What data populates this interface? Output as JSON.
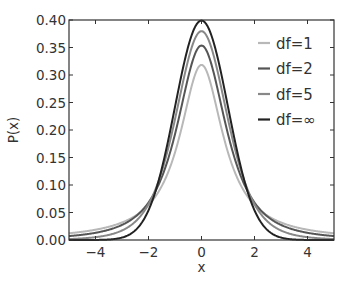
{
  "chart_data": {
    "type": "line",
    "title": "",
    "xlabel": "x",
    "ylabel": "P(x)",
    "xlim": [
      -5,
      5
    ],
    "ylim": [
      0,
      0.4
    ],
    "grid": false,
    "legend_position": "upper right",
    "x_ticks": [
      "−4",
      "−2",
      "0",
      "2",
      "4"
    ],
    "x_tick_values": [
      -4,
      -2,
      0,
      2,
      4
    ],
    "y_ticks": [
      "0.00",
      "0.05",
      "0.10",
      "0.15",
      "0.20",
      "0.25",
      "0.30",
      "0.35",
      "0.40"
    ],
    "y_tick_values": [
      0,
      0.05,
      0.1,
      0.15,
      0.2,
      0.25,
      0.3,
      0.35,
      0.4
    ],
    "series": [
      {
        "name": "df=1",
        "df": 1,
        "color": "#b8b8b8",
        "peak": 0.318,
        "x": [
          -5,
          -4,
          -3,
          -2,
          -1,
          0,
          1,
          2,
          3,
          4,
          5
        ],
        "values": [
          0.012,
          0.019,
          0.032,
          0.064,
          0.159,
          0.318,
          0.159,
          0.064,
          0.032,
          0.019,
          0.012
        ]
      },
      {
        "name": "df=2",
        "df": 2,
        "color": "#555555",
        "peak": 0.354,
        "x": [
          -5,
          -4,
          -3,
          -2,
          -1,
          0,
          1,
          2,
          3,
          4,
          5
        ],
        "values": [
          0.007,
          0.013,
          0.027,
          0.068,
          0.192,
          0.354,
          0.192,
          0.068,
          0.027,
          0.013,
          0.007
        ]
      },
      {
        "name": "df=5",
        "df": 5,
        "color": "#888888",
        "peak": 0.38,
        "x": [
          -5,
          -4,
          -3,
          -2,
          -1,
          0,
          1,
          2,
          3,
          4,
          5
        ],
        "values": [
          0.002,
          0.005,
          0.017,
          0.065,
          0.22,
          0.38,
          0.22,
          0.065,
          0.017,
          0.005,
          0.002
        ]
      },
      {
        "name": "df=∞",
        "df": "inf",
        "color": "#222222",
        "peak": 0.399,
        "x": [
          -5,
          -4,
          -3,
          -2,
          -1,
          0,
          1,
          2,
          3,
          4,
          5
        ],
        "values": [
          0.0,
          0.0,
          0.004,
          0.054,
          0.242,
          0.399,
          0.242,
          0.054,
          0.004,
          0.0,
          0.0
        ]
      }
    ]
  }
}
